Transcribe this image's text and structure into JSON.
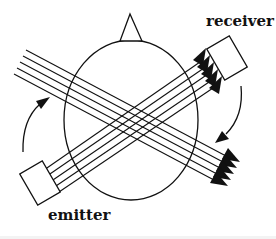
{
  "diagram": {
    "labels": {
      "receiver": "receiver",
      "emitter": "emitter"
    },
    "elements": {
      "head": "head-outline-ellipse",
      "nose": "nose-triangle-marker",
      "emitter_box": "emitter-rectangle",
      "receiver_box": "receiver-rectangle",
      "beam_emitter_to_receiver": {
        "line_count": 5,
        "arrowheads": 5,
        "direction": "lower-left to upper-right"
      },
      "beam_crossing": {
        "line_count": 5,
        "arrowheads": 5,
        "direction": "upper-left to lower-right"
      },
      "rotation_arrows": [
        "left-arc-clockwise-up",
        "right-arc-clockwise-down"
      ]
    },
    "colors": {
      "stroke": "#111111",
      "background": "#ffffff"
    }
  }
}
